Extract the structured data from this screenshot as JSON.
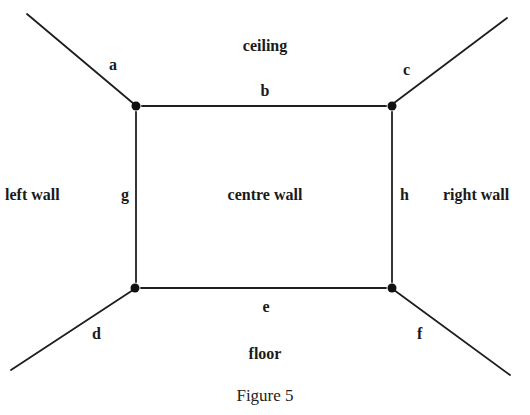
{
  "diagram": {
    "caption": "Figure 5",
    "regions": {
      "ceiling": "ceiling",
      "left_wall": "left wall",
      "centre_wall": "centre wall",
      "right_wall": "right wall",
      "floor": "floor"
    },
    "edges": {
      "a": "a",
      "b": "b",
      "c": "c",
      "d": "d",
      "e": "e",
      "f": "f",
      "g": "g",
      "h": "h"
    },
    "vertices": [
      {
        "name": "top-left",
        "x": 136,
        "y": 106
      },
      {
        "name": "top-right",
        "x": 392,
        "y": 106
      },
      {
        "name": "bottom-left",
        "x": 135,
        "y": 288
      },
      {
        "name": "bottom-right",
        "x": 392,
        "y": 288
      }
    ],
    "colors": {
      "line": "#1e1e1e",
      "background": "#ffffff"
    }
  }
}
